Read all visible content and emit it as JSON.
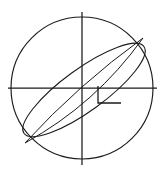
{
  "figure": {
    "type": "technical-line-drawing",
    "canvas": {
      "width": 165,
      "height": 176,
      "background": "#ffffff"
    },
    "stroke_color": "#1a1a1a",
    "fill": "none"
  },
  "geometry": {
    "circle": {
      "name": "outer-circle",
      "cx": 82,
      "cy": 88,
      "r": 71,
      "bounds": {
        "left": 11,
        "right": 153,
        "top": 17,
        "bottom": 159
      }
    },
    "centerlines": {
      "vertical": {
        "x": 82,
        "y1": 12,
        "y2": 165
      },
      "horizontal": {
        "y": 88,
        "x1": 8,
        "x2": 157
      }
    },
    "ellipse": {
      "name": "tilted-ellipse",
      "cx": 84,
      "cy": 90,
      "rx": 74,
      "ry": 21,
      "rotation_deg": -36,
      "tip_upper_right": {
        "x": 143,
        "y": 38
      },
      "tip_lower_left": {
        "x": 25,
        "y": 143
      }
    },
    "inner_arcs": {
      "count": 2,
      "description": "two inner lens arcs sharing the ellipse tips",
      "arcs": [
        {
          "name": "inner-arc-upper",
          "bulge": 9
        },
        {
          "name": "inner-arc-lower",
          "bulge": 4
        }
      ]
    },
    "angle_marker": {
      "name": "right-angle-marker",
      "vertical": {
        "x": 98,
        "y1": 86,
        "y2": 103
      },
      "horizontal": {
        "y": 103,
        "x1": 98,
        "x2": 121
      }
    }
  },
  "labels": {
    "has_text": false,
    "text_items": []
  }
}
